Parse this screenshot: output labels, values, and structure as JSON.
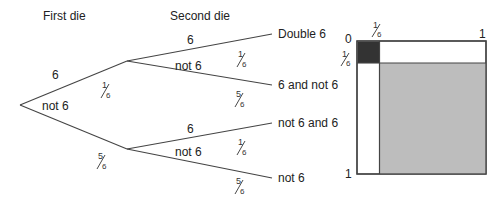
{
  "tree": {
    "headers": {
      "first": "First die",
      "second": "Second die"
    },
    "first_branches": {
      "upper": {
        "label": "6",
        "prob_num": "1",
        "prob_den": "6"
      },
      "lower": {
        "label": "not 6",
        "prob_num": "5",
        "prob_den": "6"
      }
    },
    "second_branches_upper": {
      "six": {
        "label": "6",
        "prob_num": "1",
        "prob_den": "6",
        "outcome": "Double 6"
      },
      "not_six": {
        "label": "not 6",
        "prob_num": "5",
        "prob_den": "6",
        "outcome": "6 and not 6"
      }
    },
    "second_branches_lower": {
      "six": {
        "label": "6",
        "prob_num": "1",
        "prob_den": "6",
        "outcome": "not 6 and 6"
      },
      "not_six": {
        "label": "not 6",
        "prob_num": "5",
        "prob_den": "6",
        "outcome": "not 6"
      }
    }
  },
  "square": {
    "top_left": "0",
    "top_right": "1",
    "bottom_left": "1",
    "top_tick": {
      "num": "1",
      "den": "6"
    },
    "left_tick": {
      "num": "1",
      "den": "6"
    },
    "colors": {
      "double_six": "#333333",
      "neither": "#bdbdbd",
      "border": "#444444"
    }
  }
}
